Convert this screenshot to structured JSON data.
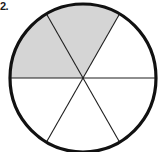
{
  "figure": {
    "label": "2.",
    "kind": "fraction-circle",
    "background_color": "#ffffff"
  },
  "chart_data": {
    "type": "pie",
    "title": "",
    "subtitle": "",
    "xlabel": "",
    "ylabel": "",
    "legend_position": "none",
    "grid": false,
    "categories": [
      "sector 1",
      "sector 2",
      "sector 3",
      "sector 4",
      "sector 5",
      "sector 6"
    ],
    "values": [
      1,
      1,
      1,
      1,
      1,
      1
    ],
    "total_sectors": 6,
    "shaded_sectors": 2,
    "fraction_shaded": "2/6",
    "shaded_indices": [
      0,
      1
    ],
    "sector_angle_degrees": 60,
    "shaded_span_degrees": 120,
    "shaded_start_angle_degrees": 180,
    "shaded_end_angle_degrees": 300,
    "annotations": []
  },
  "geometry": {
    "center_x": 83,
    "center_y": 78,
    "radius_x": 73,
    "radius_y": 74,
    "outline_width": 3.2,
    "divider_width": 1.1
  },
  "colors": {
    "shaded_fill": "#d5d5d5",
    "unshaded_fill": "#ffffff",
    "outline_stroke": "#111111",
    "divider_stroke": "#1e1e1e",
    "label_color": "#1a1a1a"
  }
}
